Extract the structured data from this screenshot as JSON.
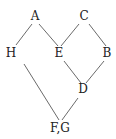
{
  "diagram": {
    "type": "hasse-diagram",
    "nodes": [
      {
        "id": "A",
        "label": "A",
        "x": 35,
        "y": 20
      },
      {
        "id": "C",
        "label": "C",
        "x": 84,
        "y": 20
      },
      {
        "id": "H",
        "label": "H",
        "x": 11,
        "y": 57
      },
      {
        "id": "E",
        "label": "E",
        "x": 59,
        "y": 57
      },
      {
        "id": "B",
        "label": "B",
        "x": 107,
        "y": 57
      },
      {
        "id": "D",
        "label": "D",
        "x": 83,
        "y": 93
      },
      {
        "id": "FG",
        "label": "F,G",
        "x": 60,
        "y": 132
      }
    ],
    "edges": [
      {
        "from": "A",
        "to": "H",
        "x1": 32,
        "y1": 24,
        "x2": 16,
        "y2": 45
      },
      {
        "from": "A",
        "to": "E",
        "x1": 39,
        "y1": 24,
        "x2": 58,
        "y2": 46
      },
      {
        "from": "C",
        "to": "E",
        "x1": 79,
        "y1": 24,
        "x2": 61,
        "y2": 46
      },
      {
        "from": "C",
        "to": "B",
        "x1": 89,
        "y1": 24,
        "x2": 106,
        "y2": 46
      },
      {
        "from": "E",
        "to": "D",
        "x1": 64,
        "y1": 61,
        "x2": 81,
        "y2": 83
      },
      {
        "from": "B",
        "to": "D",
        "x1": 104,
        "y1": 61,
        "x2": 86,
        "y2": 83
      },
      {
        "from": "H",
        "to": "FG",
        "x1": 24,
        "y1": 64,
        "x2": 59,
        "y2": 120
      },
      {
        "from": "D",
        "to": "FG",
        "x1": 78,
        "y1": 98,
        "x2": 62,
        "y2": 120
      }
    ]
  }
}
